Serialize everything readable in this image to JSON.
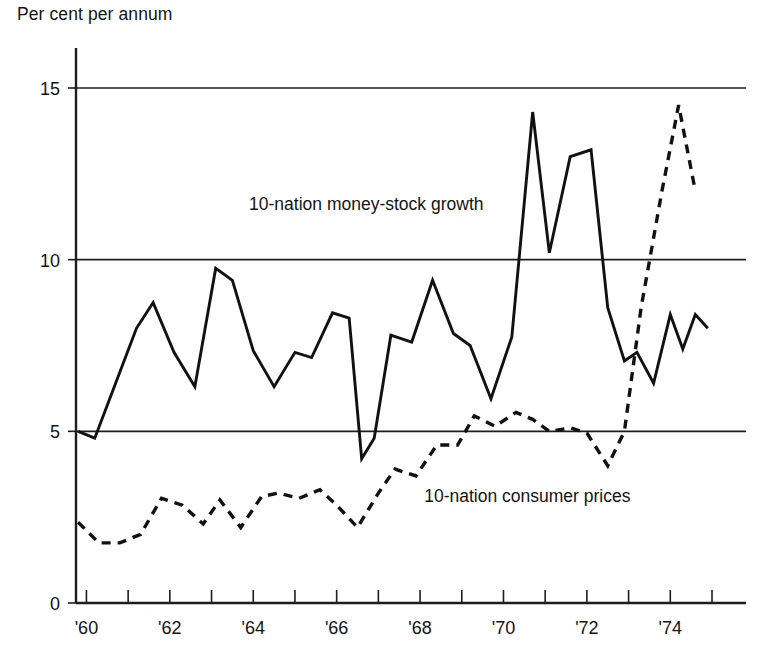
{
  "chart_data": {
    "type": "line",
    "title": "",
    "ylabel": "Per cent per annum",
    "xlabel": "",
    "ylim": [
      0,
      15
    ],
    "yticks": [
      0,
      5,
      10,
      15
    ],
    "ytick_labels": [
      "0",
      "5",
      "10",
      "15"
    ],
    "xlim": [
      1959.75,
      1975.0
    ],
    "xticks": [
      1960,
      1961,
      1962,
      1963,
      1964,
      1965,
      1966,
      1967,
      1968,
      1969,
      1970,
      1971,
      1972,
      1973,
      1974,
      1975
    ],
    "xtick_labels": [
      "'60",
      "",
      "'62",
      "",
      "'64",
      "",
      "'66",
      "",
      "'68",
      "",
      "'70",
      "",
      "'72",
      "",
      "'74",
      ""
    ],
    "grid": "horizontal-gridlines-at-5-10-15",
    "legend_position": "inline-annotations",
    "series": [
      {
        "name": "10-nation money-stock growth",
        "style": "solid",
        "label": "10-nation money-stock growth",
        "label_x": 1963.9,
        "label_y": 11.45,
        "x": [
          1959.8,
          1960.2,
          1960.7,
          1961.2,
          1961.6,
          1962.1,
          1962.6,
          1963.1,
          1963.5,
          1964.0,
          1964.5,
          1965.0,
          1965.4,
          1965.9,
          1966.3,
          1966.6,
          1966.9,
          1967.3,
          1967.8,
          1968.3,
          1968.8,
          1969.2,
          1969.7,
          1970.2,
          1970.7,
          1971.1,
          1971.6,
          1972.1,
          1972.5,
          1972.9,
          1973.2,
          1973.6,
          1974.0,
          1974.3,
          1974.6,
          1974.9
        ],
        "y": [
          5.0,
          4.8,
          6.4,
          8.0,
          8.75,
          7.3,
          6.3,
          9.75,
          9.4,
          7.35,
          6.3,
          7.3,
          7.15,
          8.45,
          8.3,
          4.2,
          4.8,
          7.8,
          7.6,
          9.4,
          7.85,
          7.5,
          5.95,
          7.75,
          14.3,
          10.2,
          13.0,
          13.2,
          8.6,
          7.05,
          7.3,
          6.4,
          8.4,
          7.4,
          8.4,
          8.0
        ]
      },
      {
        "name": "10-nation consumer prices",
        "style": "dashed",
        "label": "10-nation consumer prices",
        "label_x": 1968.1,
        "label_y": 2.95,
        "x": [
          1959.8,
          1960.3,
          1960.8,
          1961.3,
          1961.8,
          1962.3,
          1962.8,
          1963.2,
          1963.7,
          1964.2,
          1964.6,
          1965.1,
          1965.6,
          1966.0,
          1966.5,
          1967.0,
          1967.4,
          1967.9,
          1968.4,
          1968.9,
          1969.3,
          1969.8,
          1970.3,
          1970.7,
          1971.1,
          1971.6,
          1972.0,
          1972.5,
          1972.9,
          1973.3,
          1973.8,
          1974.2,
          1974.6
        ],
        "y": [
          2.35,
          1.75,
          1.75,
          2.0,
          3.05,
          2.85,
          2.3,
          3.0,
          2.2,
          3.1,
          3.2,
          3.05,
          3.3,
          2.85,
          2.2,
          3.2,
          3.9,
          3.7,
          4.6,
          4.6,
          5.45,
          5.15,
          5.55,
          5.35,
          5.0,
          5.1,
          4.95,
          4.0,
          5.0,
          8.6,
          12.0,
          14.5,
          12.0
        ]
      }
    ]
  }
}
